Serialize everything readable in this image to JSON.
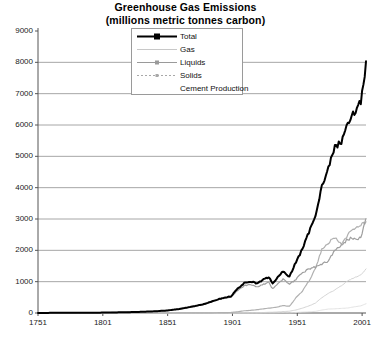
{
  "chart": {
    "title_line1": "Greenhouse Gas Emissions",
    "title_line2": "(millions metric tonnes carbon)"
  },
  "legend": {
    "items": [
      {
        "label": "Total",
        "icon": "line-with-square-marker",
        "color": "#000000"
      },
      {
        "label": "Gas",
        "icon": "thin-line",
        "color": "#c8c8c8"
      },
      {
        "label": "Liquids",
        "icon": "line-with-dot-marker",
        "color": "#9a9a9a"
      },
      {
        "label": "Solids",
        "icon": "dotted-line-with-marker",
        "color": "#a8a8a8"
      },
      {
        "label": "Cement Production",
        "icon": "no-sample",
        "color": "#dcdcdc"
      }
    ]
  },
  "axes": {
    "y_ticks": [
      "0",
      "1000",
      "2000",
      "3000",
      "4000",
      "5000",
      "6000",
      "7000",
      "8000",
      "9000"
    ],
    "x_ticks": [
      "1751",
      "1801",
      "1851",
      "1901",
      "1951",
      "2001"
    ]
  },
  "chart_data": {
    "type": "line",
    "title": "Greenhouse Gas Emissions (millions metric tonnes carbon)",
    "xlabel": "",
    "ylabel": "",
    "xlim": [
      1751,
      2004
    ],
    "ylim": [
      0,
      9000
    ],
    "grid": "horizontal",
    "legend_position": "top-center-inside",
    "x": [
      1751,
      1760,
      1770,
      1780,
      1790,
      1800,
      1810,
      1820,
      1830,
      1840,
      1850,
      1860,
      1870,
      1880,
      1890,
      1900,
      1905,
      1910,
      1915,
      1920,
      1925,
      1929,
      1932,
      1935,
      1940,
      1945,
      1950,
      1955,
      1960,
      1965,
      1970,
      1975,
      1980,
      1985,
      1990,
      1995,
      2000,
      2004
    ],
    "series": [
      {
        "name": "Total",
        "color": "#000000",
        "values": [
          3,
          4,
          5,
          7,
          9,
          12,
          18,
          25,
          37,
          52,
          77,
          129,
          203,
          296,
          441,
          534,
          779,
          950,
          1010,
          941,
          1068,
          1145,
          947,
          1092,
          1324,
          1160,
          1630,
          2043,
          2577,
          3136,
          4053,
          4615,
          5313,
          5446,
          6096,
          6399,
          6770,
          7910
        ]
      },
      {
        "name": "Solids",
        "color": "#9e9e9e",
        "values": [
          3,
          4,
          5,
          7,
          9,
          12,
          18,
          25,
          37,
          52,
          76,
          126,
          198,
          288,
          429,
          513,
          725,
          863,
          914,
          824,
          924,
          977,
          771,
          901,
          1076,
          932,
          1070,
          1283,
          1419,
          1464,
          1556,
          1673,
          1999,
          2152,
          2360,
          2389,
          2390,
          3010
        ]
      },
      {
        "name": "Liquids",
        "color": "#b0b0b0",
        "values": [
          0,
          0,
          0,
          0,
          0,
          0,
          0,
          0,
          0,
          0,
          0,
          1,
          2,
          4,
          9,
          17,
          40,
          70,
          85,
          105,
          135,
          157,
          167,
          185,
          241,
          216,
          490,
          703,
          1020,
          1419,
          2051,
          2245,
          2411,
          2186,
          2497,
          2718,
          2835,
          2880
        ]
      },
      {
        "name": "Gas",
        "color": "#cfcfcf",
        "values": [
          0,
          0,
          0,
          0,
          0,
          0,
          0,
          0,
          0,
          0,
          0,
          0,
          1,
          2,
          3,
          4,
          6,
          9,
          11,
          12,
          16,
          23,
          25,
          32,
          45,
          57,
          97,
          155,
          227,
          314,
          492,
          627,
          736,
          870,
          1030,
          1131,
          1214,
          1400
        ]
      },
      {
        "name": "Cement Production",
        "color": "#e0e0e0",
        "values": [
          0,
          0,
          0,
          0,
          0,
          0,
          0,
          0,
          0,
          0,
          0,
          0,
          0,
          0,
          0,
          0,
          1,
          2,
          2,
          2,
          5,
          7,
          5,
          8,
          11,
          8,
          18,
          29,
          39,
          52,
          95,
          127,
          133,
          148,
          160,
          198,
          226,
          298
        ]
      }
    ]
  }
}
